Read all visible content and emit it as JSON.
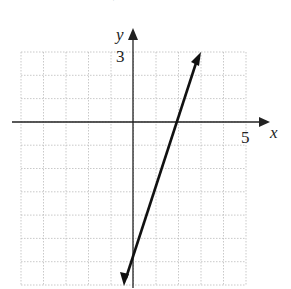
{
  "header": {
    "partial_text": "m = 3, b = −6"
  },
  "chart_data": {
    "type": "line",
    "title": "",
    "xlabel": "x",
    "ylabel": "y",
    "xlim": [
      -5,
      5
    ],
    "ylim": [
      -7,
      3
    ],
    "grid": true,
    "tick_labels": {
      "x": [
        "5"
      ],
      "y": [
        "3"
      ]
    },
    "series": [
      {
        "name": "y = 3x - 6",
        "slope": 3,
        "intercept": -6,
        "x": [
          -0.4,
          0,
          2,
          3
        ],
        "y": [
          -7.2,
          -6,
          0,
          3
        ]
      }
    ]
  },
  "labels": {
    "x_axis": "x",
    "y_axis": "y",
    "x_tick": "5",
    "y_tick": "3"
  }
}
